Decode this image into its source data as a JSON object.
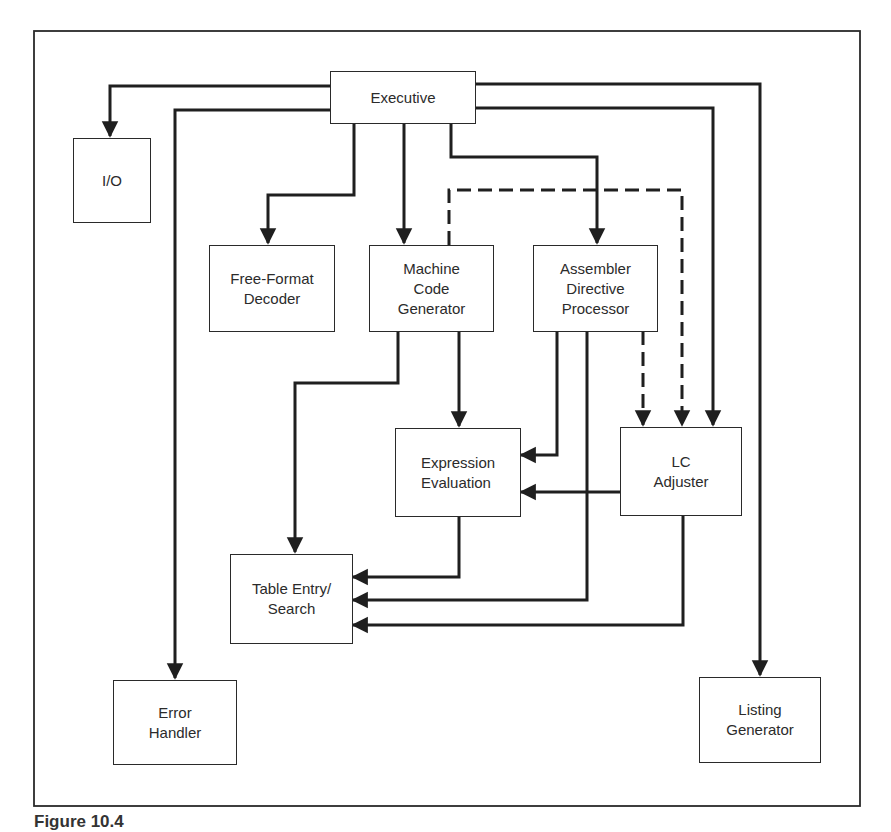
{
  "figure": {
    "caption": "Figure 10.4"
  },
  "nodes": {
    "executive": {
      "label": "Executive"
    },
    "io": {
      "label": "I/O"
    },
    "free_format_decoder": {
      "label": "Free-Format\nDecoder"
    },
    "machine_code_generator": {
      "label": "Machine\nCode\nGenerator"
    },
    "assembler_directive_processor": {
      "label": "Assembler\nDirective\nProcessor"
    },
    "expression_evaluation": {
      "label": "Expression\nEvaluation"
    },
    "lc_adjuster": {
      "label": "LC\nAdjuster"
    },
    "table_entry_search": {
      "label": "Table Entry/\nSearch"
    },
    "error_handler": {
      "label": "Error\nHandler"
    },
    "listing_generator": {
      "label": "Listing\nGenerator"
    }
  },
  "edges": [
    {
      "from": "Executive",
      "to": "I/O",
      "style": "solid"
    },
    {
      "from": "Executive",
      "to": "Error Handler",
      "style": "solid"
    },
    {
      "from": "Executive",
      "to": "Free-Format Decoder",
      "style": "solid"
    },
    {
      "from": "Executive",
      "to": "Machine Code Generator",
      "style": "solid"
    },
    {
      "from": "Executive",
      "to": "Assembler Directive Processor",
      "style": "solid"
    },
    {
      "from": "Executive",
      "to": "LC Adjuster",
      "style": "solid"
    },
    {
      "from": "Executive",
      "to": "Listing Generator",
      "style": "solid"
    },
    {
      "from": "Machine Code Generator",
      "to": "LC Adjuster",
      "style": "dashed"
    },
    {
      "from": "Assembler Directive Processor",
      "to": "LC Adjuster",
      "style": "dashed"
    },
    {
      "from": "Machine Code Generator",
      "to": "Expression Evaluation",
      "style": "solid"
    },
    {
      "from": "Machine Code Generator",
      "to": "Table Entry/Search",
      "style": "solid"
    },
    {
      "from": "Assembler Directive Processor",
      "to": "Expression Evaluation",
      "style": "solid"
    },
    {
      "from": "Assembler Directive Processor",
      "to": "Table Entry/Search",
      "style": "solid"
    },
    {
      "from": "LC Adjuster",
      "to": "Expression Evaluation",
      "style": "solid"
    },
    {
      "from": "Expression Evaluation",
      "to": "Table Entry/Search",
      "style": "solid"
    },
    {
      "from": "LC Adjuster",
      "to": "Table Entry/Search",
      "style": "solid"
    }
  ],
  "colors": {
    "line": "#1f1f1f",
    "frame": "#2a2a2a",
    "background": "#ffffff"
  }
}
